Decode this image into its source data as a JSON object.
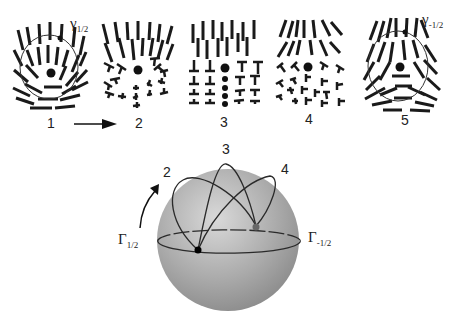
{
  "figure": {
    "panels": [
      {
        "id": 1,
        "label": "1",
        "loop_label": "γ",
        "loop_subscript": "1/2",
        "has_loop": true,
        "defect": "+1/2"
      },
      {
        "id": 2,
        "label": "2",
        "has_loop": false,
        "defect": "intermediate (biaxial)"
      },
      {
        "id": 3,
        "label": "3",
        "has_loop": false,
        "defect": "intermediate (twist)"
      },
      {
        "id": 4,
        "label": "4",
        "has_loop": false,
        "defect": "intermediate (biaxial)"
      },
      {
        "id": 5,
        "label": "5",
        "loop_label": "γ",
        "loop_subscript": "-1/2",
        "has_loop": true,
        "defect": "-1/2"
      }
    ],
    "arrow_between": [
      "1",
      "2"
    ],
    "sphere": {
      "labels": {
        "top": "3",
        "upper_left": "2",
        "upper_right": "4",
        "left_letter": "Γ",
        "left_subscript": "1/2",
        "right_letter": "Γ",
        "right_subscript": "-1/2"
      },
      "fill_light": "#d9d9d9",
      "fill_dark": "#8a8a8a",
      "line_color": "#2a2a2a",
      "front_point_color": "#000000",
      "back_point_color": "#666666"
    },
    "colors": {
      "ink": "#1a1a1a",
      "background": "#ffffff"
    }
  }
}
